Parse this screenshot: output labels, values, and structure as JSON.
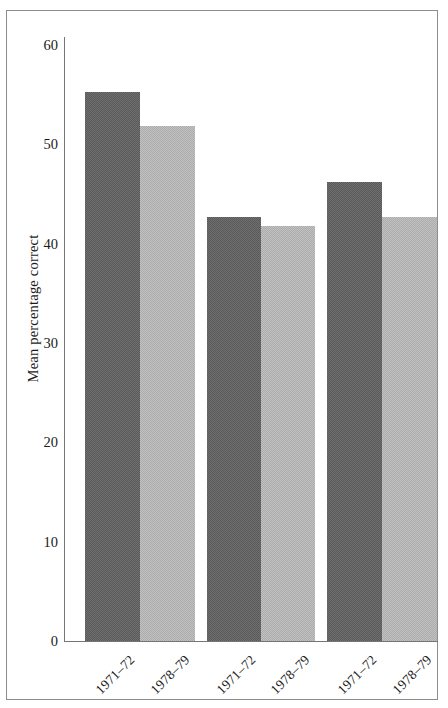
{
  "chart_data": {
    "type": "bar",
    "title": "",
    "subtitle": "",
    "xlabel": "",
    "ylabel": "Mean percentage correct",
    "ylim": [
      0,
      60
    ],
    "yticks": [
      0,
      10,
      20,
      30,
      40,
      50,
      60
    ],
    "ytick_labels": [
      "0",
      "10",
      "20",
      "30",
      "40",
      "50",
      "60"
    ],
    "grid": false,
    "legend": "none",
    "categories": [
      "1971–72",
      "1978–79",
      "1971–72",
      "1978–79",
      "1971–72",
      "1978–79"
    ],
    "values": [
      55.3,
      51.8,
      42.7,
      41.8,
      46.2,
      42.7
    ],
    "bar_shades": [
      "dark",
      "light",
      "dark",
      "light",
      "dark",
      "light"
    ],
    "colors": {
      "dark_bar": "#5a5a5a",
      "light_bar": "#abacab",
      "axis": "#757575",
      "frame": "#8d8d8d",
      "text": "#1b1b1b",
      "background": "#ffffff"
    },
    "bars": [
      {
        "label": "1971–72",
        "value": 55.3,
        "shade": "dark",
        "x": 85,
        "width": 55
      },
      {
        "label": "1978–79",
        "value": 51.8,
        "shade": "light",
        "x": 140,
        "width": 55
      },
      {
        "label": "1971–72",
        "value": 42.7,
        "shade": "dark",
        "x": 207,
        "width": 54
      },
      {
        "label": "1978–79",
        "value": 41.8,
        "shade": "light",
        "x": 261,
        "width": 54
      },
      {
        "label": "1971–72",
        "value": 46.2,
        "shade": "dark",
        "x": 327,
        "width": 55
      },
      {
        "label": "1978–79",
        "value": 42.7,
        "shade": "light",
        "x": 382,
        "width": 55
      }
    ]
  },
  "axis": {
    "y_title": "Mean percentage correct",
    "y_ticks": [
      {
        "value": 60,
        "label": "60"
      },
      {
        "value": 50,
        "label": "50"
      },
      {
        "value": 40,
        "label": "40"
      },
      {
        "value": 30,
        "label": "30"
      },
      {
        "value": 20,
        "label": "20"
      },
      {
        "value": 10,
        "label": "10"
      },
      {
        "value": 0,
        "label": "0"
      }
    ]
  }
}
